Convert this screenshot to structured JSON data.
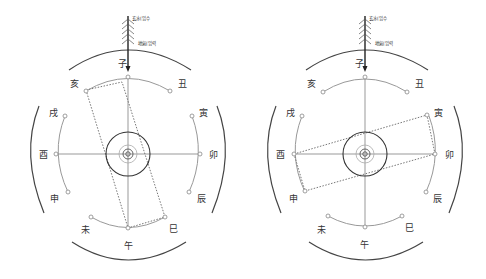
{
  "panels": [
    {
      "id": "left",
      "top_labels": {
        "water": "玄水(입수",
        "energy": "地氣(입력"
      },
      "branches": {
        "zi": "子",
        "chou": "丑",
        "yin": "寅",
        "mao": "卯",
        "chen": "辰",
        "si": "巳",
        "wu": "午",
        "wei": "未",
        "shen": "申",
        "you": "酉",
        "xu": "戌",
        "hai": "亥"
      },
      "dotted_rectangle": {
        "from": "亥",
        "to": "巳",
        "orientation": "near-vertical"
      }
    },
    {
      "id": "right",
      "top_labels": {
        "water": "玄水(입수",
        "energy": "地氣(입력"
      },
      "branches": {
        "zi": "子",
        "chou": "丑",
        "yin": "寅",
        "mao": "卯",
        "chen": "辰",
        "si": "巳",
        "wu": "午",
        "wei": "未",
        "shen": "申",
        "you": "酉",
        "xu": "戌",
        "hai": "亥"
      },
      "dotted_rectangle": {
        "from": "申/酉",
        "to": "寅/卯",
        "orientation": "near-horizontal"
      }
    }
  ],
  "colors": {
    "outer_arc": "#444444",
    "inner_arc": "#999999",
    "dotted": "#777777",
    "arrow": "#222222"
  }
}
